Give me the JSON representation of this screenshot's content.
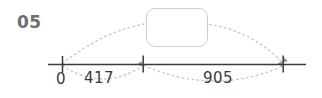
{
  "diagram": {
    "step_number": "05",
    "answer_box": {
      "value": "",
      "placeholder": ""
    },
    "number_line": {
      "origin_label": "0",
      "ticks": [
        {
          "label": "0",
          "x": 62
        },
        {
          "label": "",
          "x": 143
        },
        {
          "label": "",
          "x": 283
        }
      ],
      "jumps": [
        {
          "label": "417",
          "from": 62,
          "to": 143,
          "direction": "below"
        },
        {
          "label": "905",
          "from": 143,
          "to": 283,
          "direction": "below"
        }
      ],
      "total_jumps": [
        {
          "label": "",
          "from": 62,
          "to": 178,
          "direction": "above"
        },
        {
          "label": "",
          "from": 178,
          "to": 283,
          "direction": "above"
        }
      ]
    },
    "colors": {
      "step_number": "#6e6e6e",
      "axis_line": "#3a3a3a",
      "tick": "#3a3a3a",
      "label_text": "#3a3a3a",
      "dotted_arc": "#c8c8c8",
      "box_border": "#cfcfcf",
      "background": "#ffffff"
    }
  }
}
